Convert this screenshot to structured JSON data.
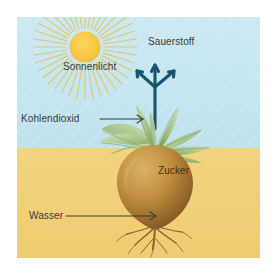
{
  "diagram": {
    "language": "de",
    "type": "labelled-illustration",
    "canvas": {
      "width": 276,
      "height": 272
    },
    "frame": {
      "margin_color": "#ffffff",
      "content_inset": 17
    },
    "scene": {
      "sky": {
        "name": "sky-region",
        "color": "#c5e5f0",
        "from_y": 0,
        "to_y": 131
      },
      "ground": {
        "name": "ground-region",
        "color": "#f0d077",
        "from_y": 131,
        "to_y": 241
      },
      "horizon_y": 131
    },
    "sun": {
      "name": "sun",
      "disc_color": "#f7c743",
      "ray_color": "#e8c86a",
      "center_x": 68,
      "center_y": 30,
      "radius": 15,
      "ray_count": 40
    },
    "plant": {
      "name": "sugar-beet-plant",
      "leaf_color_light": "#cfe0b4",
      "leaf_color_mid": "#9cbd7e",
      "leaf_color_dark": "#6e9356",
      "beet_color_light": "#d3a85a",
      "beet_color_mid": "#b8863c",
      "beet_color_dark": "#7d5824",
      "root_color": "#8a6230"
    },
    "oxygen_arrow": {
      "name": "oxygen-arrow",
      "color": "#17556e",
      "shape": "trident",
      "prongs": 3,
      "direction": "up"
    },
    "labels": [
      {
        "id": "sonnenlicht",
        "text": "Sonnenlicht",
        "meaning": "sunlight",
        "x": 63,
        "y": 62,
        "has_arrow": false
      },
      {
        "id": "sauerstoff",
        "text": "Sauerstoff",
        "meaning": "oxygen",
        "x": 148,
        "y": 37,
        "has_arrow": true,
        "arrow": {
          "style": "trident-up",
          "color": "#17556e"
        }
      },
      {
        "id": "kohlendioxid",
        "text": "Kohlendioxid",
        "meaning": "carbon dioxide",
        "x": 21,
        "y": 114,
        "has_arrow": true,
        "arrow": {
          "style": "line-right",
          "color": "#3a3a3a",
          "x1": 83,
          "x2": 126,
          "y": 102
        }
      },
      {
        "id": "zucker",
        "text": "Zucker",
        "meaning": "sugar",
        "x": 158,
        "y": 166,
        "has_arrow": false
      },
      {
        "id": "wasser",
        "text": "Wasser",
        "meaning": "water",
        "x": 29,
        "y": 211,
        "has_arrow": true,
        "arrow": {
          "style": "line-right",
          "color": "#3a3a3a",
          "x1": 49,
          "x2": 139,
          "y": 199
        }
      }
    ]
  }
}
